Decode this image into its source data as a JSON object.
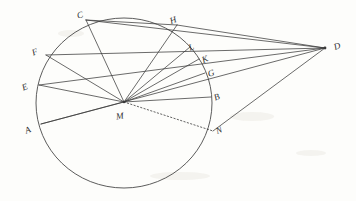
{
  "figure": {
    "background_color": "#fdfdfb",
    "ink_color": "#3a3a3a",
    "canvas": {
      "width": 356,
      "height": 201
    },
    "circle": {
      "cx": 124,
      "cy": 103,
      "r": 88,
      "stroke": "#4a4a4a"
    },
    "points": [
      {
        "id": "A",
        "label": "A",
        "x": 41,
        "y": 124,
        "label_x": 25,
        "label_y": 126,
        "on": "circle",
        "rotate": -22
      },
      {
        "id": "B",
        "label": "B",
        "x": 211,
        "y": 97,
        "label_x": 214,
        "label_y": 93,
        "on": "circle",
        "rotate": -22
      },
      {
        "id": "C",
        "label": "C",
        "x": 86,
        "y": 20,
        "label_x": 77,
        "label_y": 11,
        "on": "circle",
        "rotate": -18
      },
      {
        "id": "D",
        "label": "D",
        "x": 325,
        "y": 48,
        "label_x": 334,
        "label_y": 42,
        "on": "external",
        "rotate": -20
      },
      {
        "id": "E",
        "label": "E",
        "x": 39,
        "y": 85,
        "label_x": 22,
        "label_y": 83,
        "on": "circle",
        "rotate": -22
      },
      {
        "id": "F",
        "label": "F",
        "x": 46,
        "y": 55,
        "label_x": 32,
        "label_y": 48,
        "on": "circle",
        "rotate": -22
      },
      {
        "id": "G",
        "label": "G",
        "x": 205,
        "y": 73,
        "label_x": 208,
        "label_y": 69,
        "on": "chord-intersection",
        "rotate": -20
      },
      {
        "id": "H",
        "label": "H",
        "x": 177,
        "y": 25,
        "label_x": 170,
        "label_y": 16,
        "on": "circle",
        "rotate": -20
      },
      {
        "id": "K",
        "label": "K",
        "x": 199,
        "y": 59,
        "label_x": 202,
        "label_y": 55,
        "on": "chord-intersection",
        "rotate": -22
      },
      {
        "id": "L",
        "label": "L",
        "x": 190,
        "y": 47,
        "label_x": 189,
        "label_y": 43,
        "on": "chord-intersection",
        "rotate": -22
      },
      {
        "id": "M",
        "label": "M",
        "x": 124,
        "y": 102,
        "label_x": 116,
        "label_y": 112,
        "on": "center",
        "rotate": -8
      },
      {
        "id": "N",
        "label": "N",
        "x": 213,
        "y": 131,
        "label_x": 216,
        "label_y": 126,
        "on": "circle",
        "rotate": -22
      }
    ],
    "solid_segments": [
      {
        "from": "C",
        "to": "M"
      },
      {
        "from": "C",
        "to": "D"
      },
      {
        "from": "F",
        "to": "M"
      },
      {
        "from": "F",
        "to": "D"
      },
      {
        "from": "E",
        "to": "M"
      },
      {
        "from": "E",
        "to": "D"
      },
      {
        "from": "A",
        "to": "M"
      },
      {
        "from": "A",
        "to": "D"
      },
      {
        "from": "H",
        "to": "M"
      },
      {
        "from": "H",
        "to": "D"
      },
      {
        "from": "L",
        "to": "M"
      },
      {
        "from": "K",
        "to": "M"
      },
      {
        "from": "G",
        "to": "M"
      },
      {
        "from": "B",
        "to": "M"
      },
      {
        "from": "N",
        "to": "D"
      },
      {
        "from": "C",
        "to": "H"
      }
    ],
    "dotted_segments": [
      {
        "from": "M",
        "to": "N"
      }
    ]
  }
}
